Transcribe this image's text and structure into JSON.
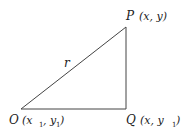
{
  "diagram": {
    "type": "right-triangle",
    "stroke_color": "#444444",
    "vertices": {
      "O": {
        "label": "O",
        "coords_text": "(x",
        "sub1": "1",
        "mid": ", y",
        "sub2": "1",
        "close": ")"
      },
      "P": {
        "label": "P",
        "coords_text": "(x, y)"
      },
      "Q": {
        "label": "Q",
        "coords_text": "(x, y",
        "sub2": "1",
        "close": ")"
      }
    },
    "hypotenuse_label": "r"
  }
}
